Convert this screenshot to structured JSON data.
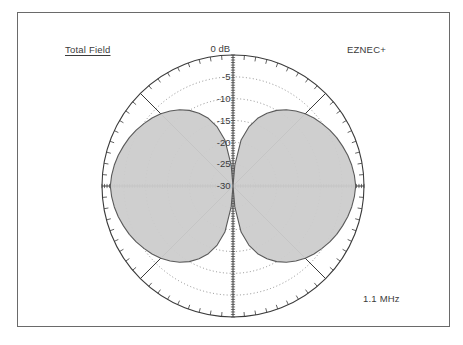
{
  "plot": {
    "title": "Total Field",
    "brand": "EZNEC+",
    "frequency": "1.1 MHz",
    "outer_ring_label": "0 dB",
    "ring_labels": [
      "-5",
      "-10",
      "-15",
      "-20",
      "-25",
      "-30"
    ]
  },
  "colors": {
    "frame": "#6a6a6a",
    "background": "#ffffff",
    "grid": "#6d6d6d",
    "axis": "#3a3a3a",
    "lobe_fill": "#cccccc",
    "lobe_stroke": "#5a5a5a",
    "text": "#3b3b3b"
  },
  "chart_data": {
    "type": "line",
    "subtype": "polar-antenna-pattern",
    "title": "Total Field",
    "annotations": [
      "Total Field",
      "EZNEC+",
      "1.1 MHz"
    ],
    "frequency_mhz": 1.1,
    "outer_ring_db": 0,
    "ring_step_db": -5,
    "ring_db_values": [
      0,
      -5,
      -10,
      -15,
      -20,
      -25,
      -30
    ],
    "ring_tick_labels": [
      "0 dB",
      "-5",
      "-10",
      "-15",
      "-20",
      "-25",
      "-30"
    ],
    "radial_range_db": [
      -30,
      0
    ],
    "grid": true,
    "legend": "none",
    "angle_unit": "degrees",
    "angle_gridlines_deg": [
      0,
      45,
      90,
      135,
      180,
      225,
      270,
      315
    ],
    "outer_tick_step_deg": 5,
    "max_gain_direction_deg": [
      90,
      270
    ],
    "null_direction_deg": [
      0,
      180
    ],
    "series": [
      {
        "name": "Total Field",
        "angles_deg": [
          0,
          5,
          10,
          15,
          20,
          25,
          30,
          35,
          40,
          45,
          50,
          55,
          60,
          65,
          70,
          75,
          80,
          85,
          90,
          95,
          100,
          105,
          110,
          115,
          120,
          125,
          130,
          135,
          140,
          145,
          150,
          155,
          160,
          165,
          170,
          175,
          180,
          185,
          190,
          195,
          200,
          205,
          210,
          215,
          220,
          225,
          230,
          235,
          240,
          245,
          250,
          255,
          260,
          265,
          270,
          275,
          280,
          285,
          290,
          295,
          300,
          305,
          310,
          315,
          320,
          325,
          330,
          335,
          340,
          345,
          350,
          355,
          360
        ],
        "values_db": [
          -30,
          -25.2,
          -19.3,
          -16.0,
          -13.5,
          -11.6,
          -10.0,
          -8.7,
          -7.6,
          -6.6,
          -5.8,
          -5.1,
          -4.4,
          -3.8,
          -3.3,
          -2.8,
          -2.4,
          -2.1,
          -1.9,
          -2.1,
          -2.4,
          -2.8,
          -3.3,
          -3.8,
          -4.4,
          -5.1,
          -5.8,
          -6.6,
          -7.6,
          -8.7,
          -10.0,
          -11.6,
          -13.5,
          -16.0,
          -19.3,
          -25.2,
          -30,
          -25.2,
          -19.3,
          -16.0,
          -13.5,
          -11.6,
          -10.0,
          -8.7,
          -7.6,
          -6.6,
          -5.8,
          -5.1,
          -4.4,
          -3.8,
          -3.3,
          -2.8,
          -2.4,
          -2.1,
          -1.9,
          -2.1,
          -2.4,
          -2.8,
          -3.3,
          -3.8,
          -4.4,
          -5.1,
          -5.8,
          -6.6,
          -7.6,
          -8.7,
          -10.0,
          -11.6,
          -13.5,
          -16.0,
          -19.3,
          -25.2,
          -30
        ]
      }
    ]
  }
}
